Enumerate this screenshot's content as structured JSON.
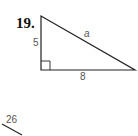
{
  "problem": {
    "number": "19.",
    "triangle": {
      "type": "right-triangle",
      "vertical_leg_label": "5",
      "horizontal_leg_label": "8",
      "hypotenuse_label": "a",
      "right_angle_marker": true
    }
  },
  "next_problem_fragment": {
    "label": "26"
  },
  "colors": {
    "line": "#222222",
    "label": "#555555",
    "number": "#111111"
  }
}
